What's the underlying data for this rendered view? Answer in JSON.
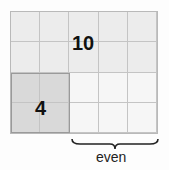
{
  "diagram": {
    "grid": {
      "columns": 5,
      "rows": 4
    },
    "regions": [
      {
        "name": "ten",
        "label": "10",
        "cols": [
          0,
          4
        ],
        "rows": [
          0,
          1
        ],
        "fill": "#ececec"
      },
      {
        "name": "four",
        "label": "4",
        "cols": [
          0,
          1
        ],
        "rows": [
          2,
          3
        ],
        "fill": "#d9d9d9"
      },
      {
        "name": "remainder",
        "label": "",
        "cols": [
          2,
          4
        ],
        "rows": [
          2,
          3
        ],
        "fill": "#f6f6f6"
      }
    ],
    "brace_label": "even",
    "colors": {
      "grid_line": "#c4c4c4",
      "dark_fill": "#d9d9d9",
      "light_fill": "#ececec",
      "white_fill": "#f6f6f6"
    }
  }
}
